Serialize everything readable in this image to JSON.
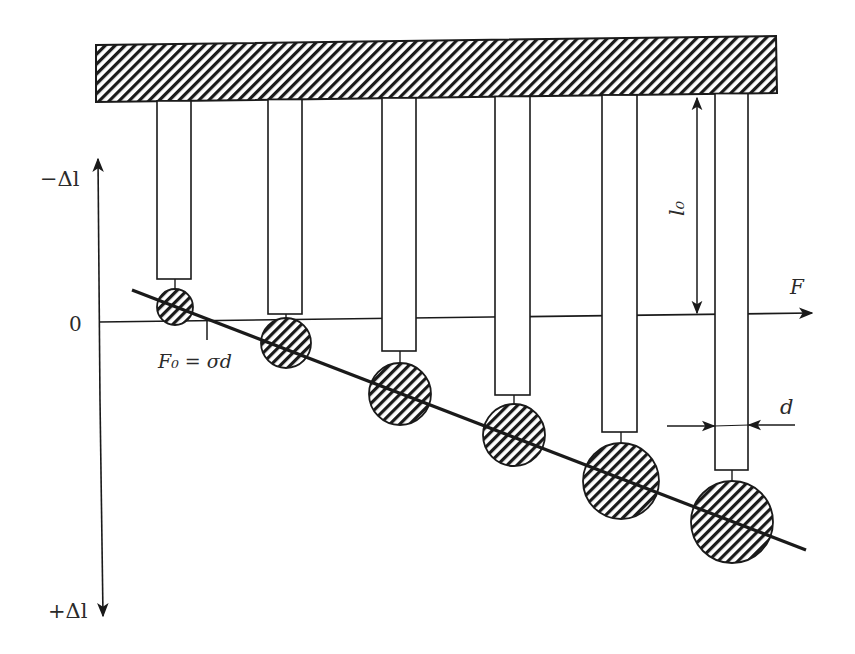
{
  "diagram": {
    "type": "physics-schematic",
    "colors": {
      "ink": "#1a1a1a",
      "background": "#ffffff"
    },
    "axes": {
      "vertical_top_label": "−Δl",
      "vertical_bottom_label": "+Δl",
      "origin_label": "0",
      "horizontal_label": "F"
    },
    "labels": {
      "intercept": "F₀ = σd",
      "rod_length": "l₀",
      "rod_diameter": "d"
    },
    "support": {
      "name": "fixed hatched support beam"
    },
    "rods": [
      {
        "x": 157,
        "w": 34,
        "bottom": 279,
        "ball_cx": 175,
        "ball_cy": 307,
        "ball_r": 18
      },
      {
        "x": 268,
        "w": 34,
        "bottom": 314,
        "ball_cx": 286,
        "ball_cy": 343,
        "ball_r": 25
      },
      {
        "x": 382,
        "w": 34,
        "bottom": 351,
        "ball_cx": 400,
        "ball_cy": 394,
        "ball_r": 31
      },
      {
        "x": 495,
        "w": 35,
        "bottom": 395,
        "ball_cx": 514,
        "ball_cy": 435,
        "ball_r": 31
      },
      {
        "x": 602,
        "w": 35,
        "bottom": 432,
        "ball_cx": 621,
        "ball_cy": 481,
        "ball_r": 38
      },
      {
        "x": 715,
        "w": 33,
        "bottom": 470,
        "ball_cx": 732,
        "ball_cy": 522,
        "ball_r": 41
      }
    ]
  }
}
